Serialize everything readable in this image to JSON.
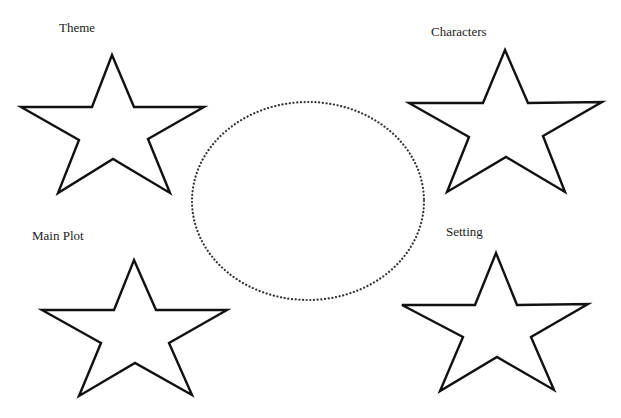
{
  "diagram": {
    "type": "story-elements-organizer",
    "center": {
      "shape": "dotted-ellipse",
      "label": ""
    },
    "stars": [
      {
        "id": "theme",
        "label": "Theme",
        "position": "top-left"
      },
      {
        "id": "characters",
        "label": "Characters",
        "position": "top-right"
      },
      {
        "id": "main-plot",
        "label": "Main Plot",
        "position": "bottom-left"
      },
      {
        "id": "setting",
        "label": "Setting",
        "position": "bottom-right"
      }
    ]
  },
  "colors": {
    "stroke": "#111111",
    "background": "#ffffff"
  }
}
